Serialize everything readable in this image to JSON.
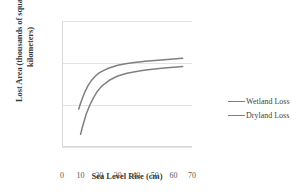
{
  "chart": {
    "type": "line",
    "xlabel": "Sea Level Rise (cm)",
    "ylabel_line1": "Lost Area (thousands of square",
    "ylabel_line2": "kilometers)",
    "ylabel_full": "Lost Area (thousands of square kilometers)",
    "yticks": [
      "100",
      "10",
      "1",
      "0.1"
    ],
    "xticks": [
      "0",
      "10",
      "20",
      "30",
      "40",
      "50",
      "60",
      "70"
    ],
    "legend": [
      {
        "label": "Wetland Loss",
        "color": "#7f7f7f"
      },
      {
        "label": "Dryland Loss",
        "color": "#808080"
      }
    ]
  },
  "chart_data": {
    "type": "line",
    "title": "",
    "subtitle": "",
    "xlabel": "Sea Level Rise (cm)",
    "ylabel": "Lost Area (thousands of square kilometers)",
    "yscale": "log",
    "xscale": "linear",
    "xlim": [
      0,
      70
    ],
    "ylim": [
      0.1,
      100
    ],
    "xticks": [
      0,
      10,
      20,
      30,
      40,
      50,
      60,
      70
    ],
    "yticks": [
      0.1,
      1,
      10,
      100
    ],
    "grid": "horizontal",
    "legend_position": "right",
    "series": [
      {
        "name": "Wetland Loss",
        "color": "#7f7f7f",
        "x": [
          9,
          10,
          12,
          14,
          16,
          18,
          20,
          22,
          25,
          30,
          35,
          40,
          45,
          50,
          55,
          60,
          65
        ],
        "y": [
          0.8,
          1.1,
          1.9,
          2.9,
          3.9,
          4.9,
          5.8,
          6.5,
          7.5,
          8.8,
          9.7,
          10.4,
          11.0,
          11.5,
          12.0,
          12.5,
          13.0
        ]
      },
      {
        "name": "Dryland Loss",
        "color": "#808080",
        "x": [
          10,
          11,
          13,
          15,
          17,
          19,
          21,
          23,
          26,
          30,
          35,
          40,
          45,
          50,
          55,
          60,
          65
        ],
        "y": [
          0.2,
          0.3,
          0.6,
          1.0,
          1.5,
          2.1,
          2.7,
          3.2,
          4.0,
          4.9,
          5.7,
          6.3,
          6.8,
          7.2,
          7.6,
          7.9,
          8.2
        ]
      }
    ]
  }
}
